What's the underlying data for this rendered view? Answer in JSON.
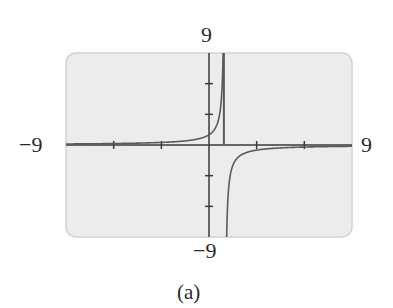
{
  "chart_data": {
    "type": "line",
    "title": "",
    "caption": "(a)",
    "function": "y = -1/(x - 1)",
    "xlim": [
      -9,
      9
    ],
    "ylim": [
      -9,
      9
    ],
    "x_tick_step": 3,
    "y_tick_step": 3,
    "axis_labels": {
      "x_min": "−9",
      "x_max": "9",
      "y_min": "−9",
      "y_max": "9"
    },
    "vertical_asymptote": 1,
    "horizontal_asymptote": 0,
    "grid": false,
    "series": [
      {
        "name": "left branch",
        "points": [
          [
            -9,
            0.1
          ],
          [
            -6,
            0.143
          ],
          [
            -3,
            0.25
          ],
          [
            -1,
            0.5
          ],
          [
            0,
            1
          ],
          [
            0.5,
            2
          ],
          [
            0.75,
            4
          ],
          [
            0.889,
            9
          ]
        ]
      },
      {
        "name": "right branch",
        "points": [
          [
            1.111,
            -9
          ],
          [
            1.25,
            -4
          ],
          [
            1.5,
            -2
          ],
          [
            2,
            -1
          ],
          [
            3,
            -0.5
          ],
          [
            6,
            -0.2
          ],
          [
            9,
            -0.125
          ]
        ]
      }
    ],
    "colors": {
      "background": "#ebebeb",
      "border": "#cfcfcf",
      "axis": "#3a3a3a",
      "curve": "#555555"
    }
  }
}
